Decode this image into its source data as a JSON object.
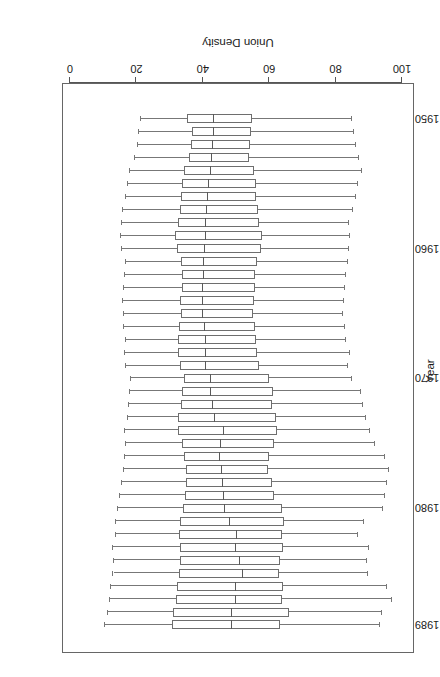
{
  "figure": {
    "width": 440,
    "height": 677,
    "background": "#ffffff",
    "rotated_180": true,
    "frame_color": "#666666",
    "box_color": "#6e6e6e",
    "whisker_color": "#777777"
  },
  "axes": {
    "density": {
      "title": "Union Density",
      "tick_labels": [
        "100",
        "80",
        "60",
        "40",
        "20",
        "0"
      ],
      "tick_values": [
        100,
        80,
        60,
        40,
        20,
        0
      ],
      "min": 0,
      "max": 100
    },
    "year": {
      "title": "Year",
      "tick_labels": [
        "1989",
        "1980",
        "1970",
        "1960",
        "1950"
      ],
      "tick_values": [
        1989,
        1980,
        1970,
        1960,
        1950
      ],
      "min": 1950,
      "max": 1989
    }
  },
  "chart_data": {
    "type": "box",
    "title": "",
    "xlabel": "Union Density",
    "ylabel": "Year",
    "orientation": "horizontal",
    "xlim": [
      0,
      100
    ],
    "ylim": [
      1950,
      1989
    ],
    "grid": false,
    "legend": "none",
    "categories": [
      1989,
      1988,
      1987,
      1986,
      1985,
      1984,
      1983,
      1982,
      1981,
      1980,
      1979,
      1978,
      1977,
      1976,
      1975,
      1974,
      1973,
      1972,
      1971,
      1970,
      1969,
      1968,
      1967,
      1966,
      1965,
      1964,
      1963,
      1962,
      1961,
      1960,
      1959,
      1958,
      1957,
      1956,
      1955,
      1954,
      1953,
      1952,
      1951,
      1950
    ],
    "boxes": [
      {
        "year": 1989,
        "whisker_low": 10.5,
        "q1": 30.7,
        "median": 48.8,
        "q3": 63.3,
        "whisker_high": 93.4
      },
      {
        "year": 1988,
        "whisker_low": 11.3,
        "q1": 31.0,
        "median": 48.8,
        "q3": 66.0,
        "whisker_high": 94.0
      },
      {
        "year": 1987,
        "whisker_low": 12.1,
        "q1": 31.9,
        "median": 50.0,
        "q3": 63.8,
        "whisker_high": 97.0
      },
      {
        "year": 1986,
        "whisker_low": 12.4,
        "q1": 32.2,
        "median": 49.9,
        "q3": 64.1,
        "whisker_high": 95.5
      },
      {
        "year": 1985,
        "whisker_low": 13.1,
        "q1": 32.8,
        "median": 52.0,
        "q3": 63.0,
        "whisker_high": 89.8
      },
      {
        "year": 1984,
        "whisker_low": 13.4,
        "q1": 33.0,
        "median": 51.1,
        "q3": 63.4,
        "whisker_high": 89.5
      },
      {
        "year": 1983,
        "whisker_low": 13.0,
        "q1": 33.1,
        "median": 50.1,
        "q3": 64.1,
        "whisker_high": 90.0
      },
      {
        "year": 1982,
        "whisker_low": 13.9,
        "q1": 32.9,
        "median": 50.3,
        "q3": 63.9,
        "whisker_high": 86.6
      },
      {
        "year": 1981,
        "whisker_low": 14.0,
        "q1": 33.2,
        "median": 48.3,
        "q3": 64.5,
        "whisker_high": 88.6
      },
      {
        "year": 1980,
        "whisker_low": 14.6,
        "q1": 34.1,
        "median": 46.6,
        "q3": 63.9,
        "whisker_high": 94.3
      },
      {
        "year": 1979,
        "whisker_low": 15.2,
        "q1": 34.6,
        "median": 46.3,
        "q3": 61.4,
        "whisker_high": 94.9
      },
      {
        "year": 1978,
        "whisker_low": 15.6,
        "q1": 35.0,
        "median": 46.1,
        "q3": 60.9,
        "whisker_high": 95.6
      },
      {
        "year": 1977,
        "whisker_low": 16.2,
        "q1": 34.9,
        "median": 45.7,
        "q3": 59.6,
        "whisker_high": 96.1
      },
      {
        "year": 1976,
        "whisker_low": 16.5,
        "q1": 34.2,
        "median": 45.3,
        "q3": 59.9,
        "whisker_high": 95.0
      },
      {
        "year": 1975,
        "whisker_low": 17.0,
        "q1": 33.6,
        "median": 45.4,
        "q3": 61.4,
        "whisker_high": 92.0
      },
      {
        "year": 1974,
        "whisker_low": 16.7,
        "q1": 32.4,
        "median": 46.5,
        "q3": 62.2,
        "whisker_high": 90.5
      },
      {
        "year": 1973,
        "whisker_low": 17.5,
        "q1": 32.6,
        "median": 43.8,
        "q3": 62.0,
        "whisker_high": 89.3
      },
      {
        "year": 1972,
        "whisker_low": 17.8,
        "q1": 33.5,
        "median": 43.1,
        "q3": 60.7,
        "whisker_high": 88.4
      },
      {
        "year": 1971,
        "whisker_low": 18.0,
        "q1": 33.8,
        "median": 42.6,
        "q3": 61.0,
        "whisker_high": 87.8
      },
      {
        "year": 1970,
        "whisker_low": 18.4,
        "q1": 34.2,
        "median": 42.4,
        "q3": 60.0,
        "whisker_high": 84.9
      },
      {
        "year": 1969,
        "whisker_low": 17.0,
        "q1": 33.1,
        "median": 40.9,
        "q3": 57.0,
        "whisker_high": 83.7
      },
      {
        "year": 1968,
        "whisker_low": 16.6,
        "q1": 32.5,
        "median": 41.0,
        "q3": 56.3,
        "whisker_high": 84.2
      },
      {
        "year": 1967,
        "whisker_low": 16.8,
        "q1": 32.6,
        "median": 41.1,
        "q3": 55.9,
        "whisker_high": 83.2
      },
      {
        "year": 1966,
        "whisker_low": 16.4,
        "q1": 32.9,
        "median": 40.7,
        "q3": 55.7,
        "whisker_high": 82.8
      },
      {
        "year": 1965,
        "whisker_low": 16.2,
        "q1": 33.4,
        "median": 40.0,
        "q3": 55.2,
        "whisker_high": 82.1
      },
      {
        "year": 1964,
        "whisker_low": 16.0,
        "q1": 33.2,
        "median": 40.1,
        "q3": 55.4,
        "whisker_high": 82.5
      },
      {
        "year": 1963,
        "whisker_low": 16.2,
        "q1": 33.6,
        "median": 40.2,
        "q3": 55.6,
        "whisker_high": 82.9
      },
      {
        "year": 1962,
        "whisker_low": 16.5,
        "q1": 33.8,
        "median": 40.3,
        "q3": 55.8,
        "whisker_high": 83.2
      },
      {
        "year": 1961,
        "whisker_low": 16.8,
        "q1": 33.5,
        "median": 40.4,
        "q3": 56.2,
        "whisker_high": 83.6
      },
      {
        "year": 1960,
        "whisker_low": 15.6,
        "q1": 32.1,
        "median": 40.7,
        "q3": 57.4,
        "whisker_high": 83.9
      },
      {
        "year": 1959,
        "whisker_low": 15.3,
        "q1": 31.7,
        "median": 40.9,
        "q3": 57.9,
        "whisker_high": 84.3
      },
      {
        "year": 1958,
        "whisker_low": 15.8,
        "q1": 32.5,
        "median": 41.1,
        "q3": 56.9,
        "whisker_high": 84.0
      },
      {
        "year": 1957,
        "whisker_low": 16.1,
        "q1": 33.1,
        "median": 41.3,
        "q3": 56.5,
        "whisker_high": 85.2
      },
      {
        "year": 1956,
        "whisker_low": 16.9,
        "q1": 33.4,
        "median": 41.7,
        "q3": 56.1,
        "whisker_high": 86.0
      },
      {
        "year": 1955,
        "whisker_low": 17.4,
        "q1": 33.8,
        "median": 42.0,
        "q3": 55.9,
        "whisker_high": 86.6
      },
      {
        "year": 1954,
        "whisker_low": 18.2,
        "q1": 34.3,
        "median": 42.4,
        "q3": 55.3,
        "whisker_high": 88.1
      },
      {
        "year": 1953,
        "whisker_low": 19.6,
        "q1": 35.9,
        "median": 42.8,
        "q3": 53.9,
        "whisker_high": 87.0
      },
      {
        "year": 1952,
        "whisker_low": 20.4,
        "q1": 36.3,
        "median": 43.1,
        "q3": 54.3,
        "whisker_high": 86.2
      },
      {
        "year": 1951,
        "whisker_low": 20.9,
        "q1": 36.8,
        "median": 43.3,
        "q3": 54.6,
        "whisker_high": 85.5
      },
      {
        "year": 1950,
        "whisker_low": 21.5,
        "q1": 35.2,
        "median": 43.5,
        "q3": 54.9,
        "whisker_high": 85.0
      }
    ]
  }
}
